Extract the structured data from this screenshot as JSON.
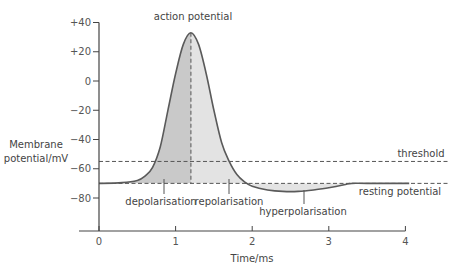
{
  "chart_data": {
    "type": "line",
    "title": "",
    "xlabel": "Time/ms",
    "ylabel": "Membrane potential/mV",
    "ylabel_lines": [
      "Membrane",
      "potential/mV"
    ],
    "xlim": [
      0,
      4
    ],
    "ylim": [
      -100,
      40
    ],
    "x_ticks": [
      0,
      1,
      2,
      3,
      4
    ],
    "x_tick_labels": [
      "0",
      "1",
      "2",
      "3",
      "4"
    ],
    "y_ticks": [
      40,
      20,
      0,
      -20,
      -40,
      -60,
      -80
    ],
    "y_tick_labels": [
      "+40",
      "+20",
      "0",
      "−20",
      "−40",
      "−60",
      "−80"
    ],
    "grid": false,
    "series": [
      {
        "name": "membrane potential",
        "x": [
          0,
          0.3,
          0.5,
          0.6,
          0.7,
          0.8,
          0.9,
          1.0,
          1.1,
          1.2,
          1.3,
          1.4,
          1.5,
          1.6,
          1.7,
          1.8,
          1.9,
          2.0,
          2.2,
          2.4,
          2.6,
          2.8,
          3.0,
          3.2,
          3.3,
          3.5,
          4.05
        ],
        "y": [
          -70,
          -69.5,
          -68,
          -65,
          -59,
          -45,
          -20,
          5,
          25,
          33,
          25,
          5,
          -20,
          -42,
          -55,
          -64,
          -69,
          -72,
          -74.5,
          -75.5,
          -75.5,
          -74.5,
          -73,
          -71,
          -70,
          -70,
          -70
        ]
      }
    ],
    "reference_lines": [
      {
        "name": "threshold",
        "value": -55,
        "style": "dashed"
      },
      {
        "name": "resting potential",
        "value": -70,
        "style": "dashed"
      },
      {
        "name": "action potential",
        "x": 1.2,
        "style": "dashed-vertical"
      }
    ],
    "annotations": [
      {
        "text": "action potential",
        "x": 1.2,
        "y": 40
      },
      {
        "text": "threshold",
        "x": 3.85,
        "y": -55
      },
      {
        "text": "resting potential",
        "x": 3.85,
        "y": -70
      },
      {
        "text": "depolarisation",
        "x": 0.85,
        "y": -80
      },
      {
        "text": "repolarisation",
        "x": 1.7,
        "y": -80
      },
      {
        "text": "hyperpolarisation",
        "x": 2.7,
        "y": -85
      }
    ],
    "regions": [
      {
        "name": "depolarisation",
        "x_range": [
          0.3,
          1.2
        ],
        "color": "#c9c9c9"
      },
      {
        "name": "repolarisation",
        "x_range": [
          1.2,
          2.0
        ],
        "color": "#e3e3e3"
      },
      {
        "name": "hyperpolarisation",
        "x_range": [
          2.0,
          3.3
        ],
        "color": "#e3e3e3"
      }
    ],
    "colors": {
      "curve": "#5a5a5a",
      "axis": "#444444",
      "dashed": "#555555",
      "depolarisation_fill": "#c9c9c9",
      "repolarisation_fill": "#e3e3e3"
    }
  },
  "labels": {
    "ylabel_line1": "Membrane",
    "ylabel_line2": "potential/mV",
    "xlabel": "Time/ms",
    "action_potential": "action potential",
    "threshold": "threshold",
    "resting_potential": "resting potential",
    "depolarisation": "depolarisation",
    "repolarisation": "repolarisation",
    "hyperpolarisation": "hyperpolarisation"
  }
}
